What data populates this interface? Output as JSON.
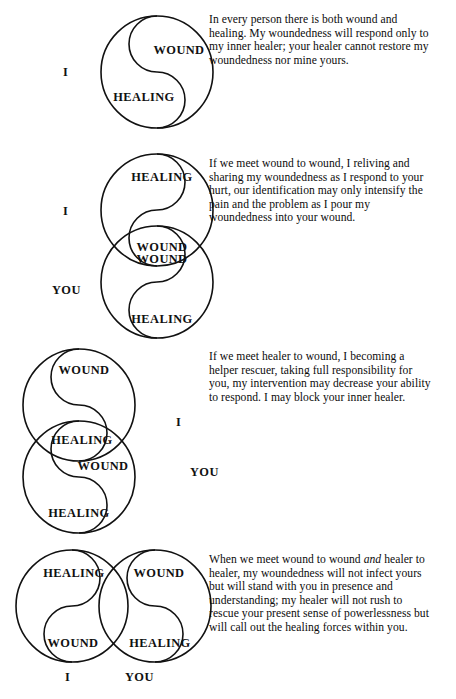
{
  "document": {
    "title": "Wound and Healing Relational Diagrams",
    "background_color": "#ffffff",
    "ink_color": "#111111",
    "labels": {
      "wound": "WOUND",
      "healing": "HEALING",
      "i": "I",
      "you": "YOU"
    }
  },
  "panels": [
    {
      "id": "panel-1",
      "name": "wound-and-healing-within-one-person",
      "side_labels": [
        {
          "text": "I",
          "position": "left-of-circle"
        }
      ],
      "circles": [
        {
          "name": "self-circle",
          "top_label": "WOUND",
          "bottom_label": "HEALING",
          "top_label_side": "right",
          "bottom_label_side": "left"
        }
      ],
      "paragraph": "In every person there is both wound and healing. My woundedness will respond only to my inner healer; your healer cannot restore my woundedness nor mine yours."
    },
    {
      "id": "panel-2",
      "name": "wound-to-wound-meeting",
      "side_labels": [
        {
          "text": "I",
          "position": "left-of-top-circle"
        },
        {
          "text": "YOU",
          "position": "left-of-bottom-circle"
        }
      ],
      "circles": [
        {
          "name": "i-circle",
          "top_label": "HEALING",
          "bottom_label": "WOUND",
          "top_label_side": "center",
          "bottom_label_side": "center"
        },
        {
          "name": "you-circle",
          "top_label": "WOUND",
          "bottom_label": "HEALING",
          "top_label_side": "center",
          "bottom_label_side": "center"
        }
      ],
      "paragraph": "If we meet wound to wound, I reliving and sharing my woundedness as I respond to your hurt, our identification may only intensify the pain and the problem as I pour my woundedness into your wound."
    },
    {
      "id": "panel-3",
      "name": "healer-to-wound-meeting",
      "side_labels": [
        {
          "text": "I",
          "position": "right-of-top-circle"
        },
        {
          "text": "YOU",
          "position": "right-of-bottom-circle"
        }
      ],
      "circles": [
        {
          "name": "i-circle",
          "top_label": "WOUND",
          "bottom_label": "HEALING",
          "top_label_side": "center",
          "bottom_label_side": "center"
        },
        {
          "name": "you-circle",
          "top_label": "WOUND",
          "bottom_label": "HEALING",
          "top_label_side": "right",
          "bottom_label_side": "center"
        }
      ],
      "paragraph": "If we meet healer to wound, I becoming a helper rescuer, taking full responsibility for you, my intervention may decrease your ability to respond. I may block your inner healer."
    },
    {
      "id": "panel-4",
      "name": "wound-to-wound-and-healer-to-healer-meeting",
      "side_labels": [
        {
          "text": "I",
          "position": "below-left-circle"
        },
        {
          "text": "YOU",
          "position": "below-right-circle"
        }
      ],
      "circles": [
        {
          "name": "i-circle",
          "top_label": "HEALING",
          "bottom_label": "WOUND",
          "top_label_side": "center",
          "bottom_label_side": "center"
        },
        {
          "name": "you-circle",
          "top_label": "WOUND",
          "bottom_label": "HEALING",
          "top_label_side": "center",
          "bottom_label_side": "center"
        }
      ],
      "paragraph_parts": {
        "before_emphasis": "When we meet wound to wound ",
        "emphasis": "and",
        "after_emphasis": " healer to healer, my woundedness will not infect yours but will stand with you in presence and understanding; my healer will not rush to rescue your present sense of powerlessness but will call out the healing forces within you."
      },
      "paragraph": "When we meet wound to wound and healer to healer, my woundedness will not infect yours but will stand with you in presence and understanding; my healer will not rush to rescue your present sense of powerlessness but will call out the healing forces within you."
    }
  ]
}
